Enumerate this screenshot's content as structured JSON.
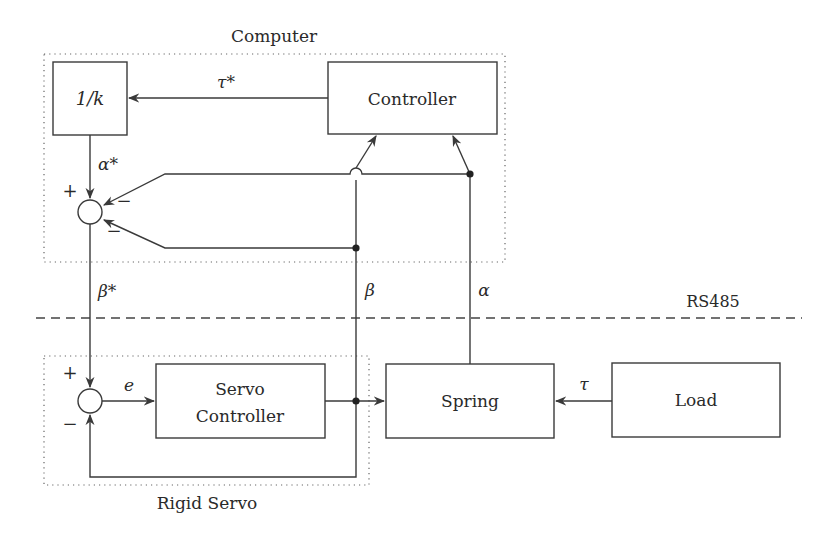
{
  "diagram": {
    "groups": {
      "computer": {
        "label": "Computer"
      },
      "rigid_servo": {
        "label": "Rigid Servo"
      }
    },
    "bus": {
      "label": "RS485"
    },
    "blocks": {
      "inv_k": "1/k",
      "controller": "Controller",
      "servo_controller_line1": "Servo",
      "servo_controller_line2": "Controller",
      "spring": "Spring",
      "load": "Load"
    },
    "signals": {
      "tau_star": "τ*",
      "alpha_star": "α*",
      "beta_star": "β*",
      "beta": "β",
      "alpha": "α",
      "e": "e",
      "tau": "τ"
    },
    "signs": {
      "sum1_plus": "+",
      "sum1_minus_upper": "−",
      "sum1_minus_lower": "−",
      "sum2_plus": "+",
      "sum2_minus": "−"
    },
    "colors": {
      "line": "#3a3a3a",
      "text": "#2a2a2a",
      "background": "#ffffff"
    }
  }
}
